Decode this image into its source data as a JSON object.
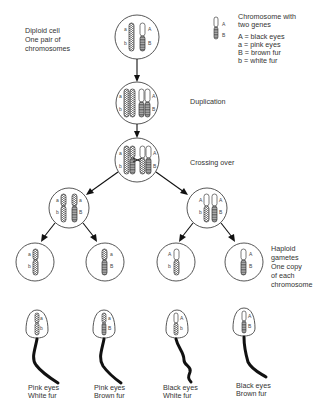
{
  "labels": {
    "diploid": [
      "Diploid cell",
      "One pair of",
      "chromosomes"
    ],
    "duplication": "Duplication",
    "crossing_over": "Crossing over",
    "haploid": [
      "Haploid",
      "gametes",
      "One copy",
      "of each",
      "chromosome"
    ]
  },
  "legend": {
    "title": [
      "Chromosome with",
      "two genes"
    ],
    "gene_A": "A",
    "gene_B": "B",
    "entries": [
      "A = black eyes",
      "a = pink eyes",
      "B = brown fur",
      "b = white fur"
    ]
  },
  "genes": {
    "A": "A",
    "a": "a",
    "B": "B",
    "b": "b"
  },
  "sperm": [
    {
      "eye": "a",
      "fur": "b",
      "caption": [
        "Pink eyes",
        "White fur"
      ]
    },
    {
      "eye": "a",
      "fur": "B",
      "caption": [
        "Pink eyes",
        "Brown fur"
      ]
    },
    {
      "eye": "A",
      "fur": "b",
      "caption": [
        "Black eyes",
        "White fur"
      ]
    },
    {
      "eye": "A",
      "fur": "B",
      "caption": [
        "Black eyes",
        "Brown fur"
      ]
    }
  ]
}
